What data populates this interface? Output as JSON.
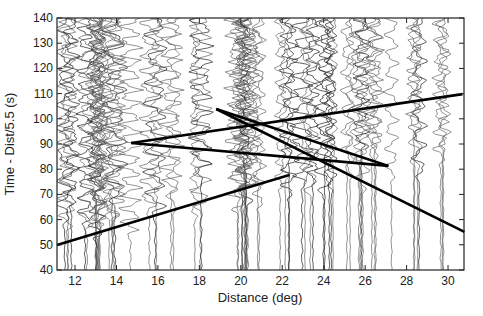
{
  "chart_data": {
    "type": "line",
    "title": "",
    "xlabel": "Distance (deg)",
    "ylabel": "Time - Dist/5.5 (s)",
    "xlim": [
      11.13,
      30.77
    ],
    "ylim": [
      40,
      140
    ],
    "xticks": [
      12,
      14,
      16,
      18,
      20,
      22,
      24,
      26,
      28,
      30
    ],
    "yticks": [
      40,
      50,
      60,
      70,
      80,
      90,
      100,
      110,
      120,
      130,
      140
    ],
    "grid": false,
    "legend": null,
    "background": "seismogram record section: many wiggle traces (gray/black) plotted vertically at distances ~11.5-30.5 deg",
    "series": [
      {
        "name": "travel-time line 1",
        "x": [
          11.13,
          22.34
        ],
        "y": [
          49.9,
          77.7
        ]
      },
      {
        "name": "travel-time line A (upper fan)",
        "x": [
          14.71,
          30.7
        ],
        "y": [
          90.4,
          109.8
        ]
      },
      {
        "name": "travel-time line B (lower fan)",
        "x": [
          14.71,
          27.12
        ],
        "y": [
          90.4,
          81.3
        ]
      },
      {
        "name": "travel-time line C1",
        "x": [
          18.81,
          27.12
        ],
        "y": [
          103.9,
          81.3
        ]
      },
      {
        "name": "travel-time line C2",
        "x": [
          18.81,
          30.79
        ],
        "y": [
          103.9,
          55.1
        ]
      }
    ],
    "colors": {
      "traces": "#555555",
      "lines": "#000000",
      "axes": "#222222"
    }
  }
}
